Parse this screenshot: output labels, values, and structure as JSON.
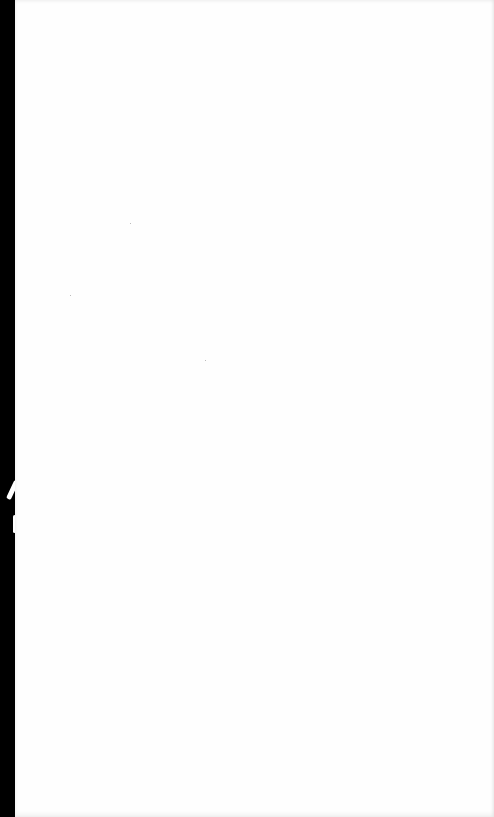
{
  "page": {
    "type": "blank-scanned-page",
    "background_color": "#ffffff",
    "binding_edge_color": "#000000",
    "text": ""
  }
}
